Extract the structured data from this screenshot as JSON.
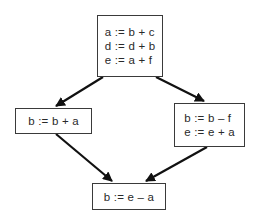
{
  "diagram": {
    "type": "control-flow-graph",
    "nodes": [
      {
        "id": "B1",
        "position": "top",
        "statements": [
          "a := b + c",
          "d := d + b",
          "e := a + f"
        ]
      },
      {
        "id": "B2",
        "position": "left",
        "statements": [
          "b := b + a"
        ]
      },
      {
        "id": "B3",
        "position": "right",
        "statements": [
          "b := b – f",
          "e := e + a"
        ]
      },
      {
        "id": "B4",
        "position": "bottom",
        "statements": [
          "b := e – a"
        ]
      }
    ],
    "edges": [
      {
        "from": "B1",
        "to": "B2"
      },
      {
        "from": "B1",
        "to": "B3"
      },
      {
        "from": "B2",
        "to": "B4"
      },
      {
        "from": "B3",
        "to": "B4"
      }
    ],
    "colors": {
      "line": "#111111",
      "box_border": "#3a3a3a",
      "text": "#2a2a2a",
      "background": "#ffffff"
    }
  }
}
